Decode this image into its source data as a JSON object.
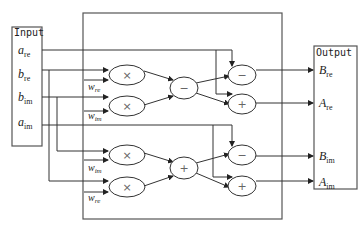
{
  "input": {
    "title": "Input",
    "signals": [
      {
        "base": "a",
        "sub": "re"
      },
      {
        "base": "b",
        "sub": "re"
      },
      {
        "base": "b",
        "sub": "im"
      },
      {
        "base": "a",
        "sub": "im"
      }
    ]
  },
  "output": {
    "title": "Output",
    "signals": [
      {
        "base": "B",
        "sub": "re"
      },
      {
        "base": "A",
        "sub": "re"
      },
      {
        "base": "B",
        "sub": "im"
      },
      {
        "base": "A",
        "sub": "im"
      }
    ]
  },
  "multipliers": [
    {
      "op": "×",
      "weight_base": "w",
      "weight_sub": "re"
    },
    {
      "op": "×",
      "weight_base": "w",
      "weight_sub": "im"
    },
    {
      "op": "×",
      "weight_base": "w",
      "weight_sub": "im"
    },
    {
      "op": "×",
      "weight_base": "w",
      "weight_sub": "re"
    }
  ],
  "middle_ops": [
    {
      "op": "−"
    },
    {
      "op": "+"
    }
  ],
  "final_ops": [
    {
      "op": "−"
    },
    {
      "op": "+"
    },
    {
      "op": "−"
    },
    {
      "op": "+"
    }
  ]
}
